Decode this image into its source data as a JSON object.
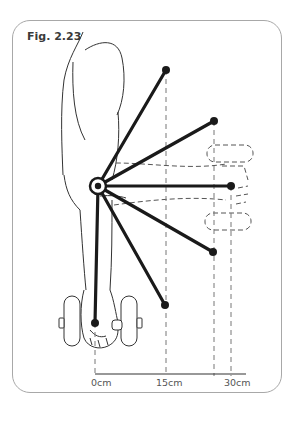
{
  "figure": {
    "label": "Fig. 2.23"
  },
  "axis": {
    "ticks": [
      {
        "label": "0cm",
        "x": 95
      },
      {
        "label": "15cm",
        "x": 165
      },
      {
        "label": "30cm",
        "x": 230
      }
    ]
  },
  "diagram": {
    "pivot": {
      "x": 98,
      "y": 186,
      "name": "elbow-joint"
    },
    "spokes": [
      {
        "x": 166,
        "y": 70
      },
      {
        "x": 214,
        "y": 121
      },
      {
        "x": 231,
        "y": 186
      },
      {
        "x": 213,
        "y": 252
      },
      {
        "x": 165,
        "y": 305
      },
      {
        "x": 95,
        "y": 323
      }
    ],
    "colors": {
      "line": "#1a1a1a",
      "dashed": "#777777",
      "frame": "#a8a8a8",
      "outline": "#333333"
    }
  }
}
